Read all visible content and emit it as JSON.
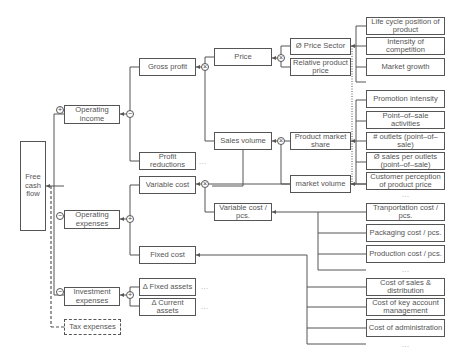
{
  "diagram": {
    "root": "Free cash flow",
    "level1": {
      "operating_income": "Operating income",
      "operating_expenses": "Operating expenses",
      "investment_expenses": "Investment expenses",
      "tax_expenses": "Tax expenses"
    },
    "level2": {
      "gross_profit": "Gross profit",
      "profit_reductions": "Profit reductions",
      "variable_cost": "Variable cost",
      "fixed_cost": "Fixed cost",
      "fixed_assets": "Δ  Fixed assets",
      "current_assets": "Δ   Current assets"
    },
    "level3": {
      "price": "Price",
      "sales_volume": "Sales volume",
      "variable_cost_pcs": "Variable cost / pcs."
    },
    "level4": {
      "price_sector": "Ø  Price Sector",
      "relative_product_price": "Relative product price",
      "product_market_share": "Product market share",
      "market_volume": "market volume"
    },
    "drivers": {
      "life_cycle": "Life cycle position of product",
      "intensity_competition": "Intensity of competition",
      "market_growth": "Market growth",
      "promotion_intensity": "Promotion intensity",
      "pos_activities": "Point–of–sale activities",
      "outlets": "# outlets (point–of–sale)",
      "sales_per_outlet": "Ø  sales per outlets (point–of–sale)",
      "customer_perception": "Customer perception of product price",
      "transport_cost": "Tranportation cost / pcs.",
      "packaging_cost": "Packaging cost / pcs.",
      "production_cost": "Production cost / pcs.",
      "cost_sales_distribution": "Cost of sales & distribution",
      "cost_key_account": "Cost of key account management",
      "cost_administration": "Cost of administration"
    },
    "operators": {
      "plus": "+",
      "minus": "−",
      "times": "×"
    },
    "ellipsis": "..."
  }
}
